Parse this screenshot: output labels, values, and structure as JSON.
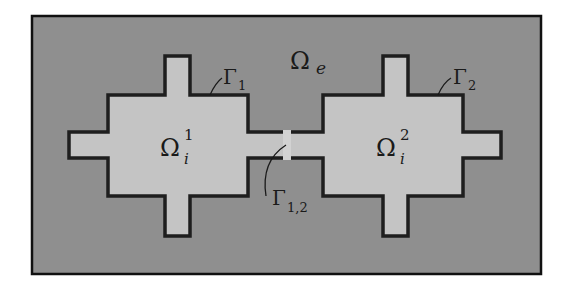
{
  "figure": {
    "colors": {
      "exterior_fill": "#8f8f8f",
      "interior_fill": "#c4c4c4",
      "boundary_stroke": "#1e1e1e",
      "frame_stroke": "#111111",
      "background": "#ffffff"
    },
    "regions": {
      "exterior": {
        "symbol": "Ω",
        "subscript": "e"
      },
      "interior_1": {
        "symbol": "Ω",
        "subscript": "i",
        "superscript": "1"
      },
      "interior_2": {
        "symbol": "Ω",
        "subscript": "i",
        "superscript": "2"
      }
    },
    "boundaries": {
      "gamma_1": {
        "symbol": "Γ",
        "subscript": "1"
      },
      "gamma_2": {
        "symbol": "Γ",
        "subscript": "2"
      },
      "gamma_12": {
        "symbol": "Γ",
        "subscript": "1,2"
      }
    }
  }
}
